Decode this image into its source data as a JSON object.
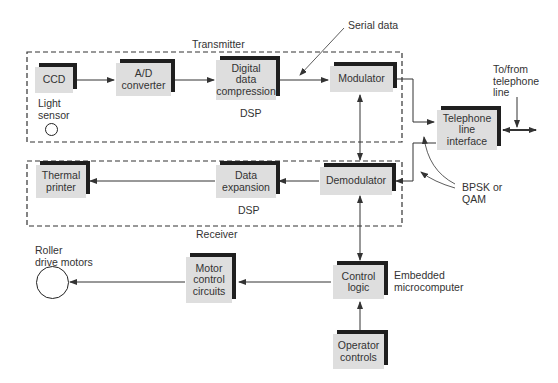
{
  "diagram": {
    "type": "block-diagram",
    "groups": {
      "transmitter": {
        "label": "Transmitter",
        "sublabel": "DSP"
      },
      "receiver": {
        "label": "Receiver",
        "sublabel": "DSP"
      }
    },
    "blocks": {
      "ccd": "CCD",
      "ad_converter": "A/D\nconverter",
      "compression": "Digital\ndata\ncompression",
      "modulator": "Modulator",
      "telephone_interface": "Telephone\nline\ninterface",
      "thermal_printer": "Thermal\nprinter",
      "expansion": "Data\nexpansion",
      "demodulator": "Demodulator",
      "motor_control": "Motor\ncontrol\ncircuits",
      "control_logic": "Control\nlogic",
      "operator_controls": "Operator\ncontrols"
    },
    "labels": {
      "light_sensor": "Light\nsensor",
      "serial_data": "Serial data",
      "to_from_line": "To/from\ntelephone\nline",
      "bpsk_qam": "BPSK or\nQAM",
      "roller_motors": "Roller\ndrive motors",
      "embedded": "Embedded\nmicrocomputer"
    },
    "connections": [
      [
        "CCD",
        "A/D converter"
      ],
      [
        "A/D converter",
        "Digital data compression"
      ],
      [
        "Digital data compression",
        "Modulator"
      ],
      [
        "Modulator",
        "Telephone line interface"
      ],
      [
        "Telephone line interface",
        "Demodulator"
      ],
      [
        "Telephone line interface",
        "Telephone line (bidirectional)"
      ],
      [
        "Demodulator",
        "Data expansion"
      ],
      [
        "Data expansion",
        "Thermal printer"
      ],
      [
        "Modulator",
        "Demodulator (bidirectional)"
      ],
      [
        "Demodulator",
        "Control logic (bidirectional)"
      ],
      [
        "Control logic",
        "Motor control circuits"
      ],
      [
        "Motor control circuits",
        "Roller drive motors"
      ],
      [
        "Operator controls",
        "Control logic"
      ]
    ],
    "colors": {
      "block_fill": "#dedede",
      "block_shadow": "#1f1f1f",
      "line": "#333333"
    }
  }
}
